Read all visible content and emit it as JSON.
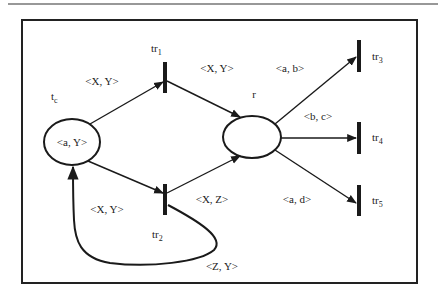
{
  "figure": {
    "type": "colored-petri-net",
    "colors": {
      "stroke": "#1a1a1a",
      "background": "#ffffff",
      "text": "#222222"
    }
  },
  "places": [
    {
      "id": "tc",
      "label": "t",
      "label_sub": "c",
      "token": "<a, Y>"
    },
    {
      "id": "r",
      "label": "r",
      "token": ""
    }
  ],
  "transitions": [
    {
      "id": "tr1",
      "label": "tr",
      "label_sub": "1"
    },
    {
      "id": "tr2",
      "label": "tr",
      "label_sub": "2"
    },
    {
      "id": "tr3",
      "label": "tr",
      "label_sub": "3"
    },
    {
      "id": "tr4",
      "label": "tr",
      "label_sub": "4"
    },
    {
      "id": "tr5",
      "label": "tr",
      "label_sub": "5"
    }
  ],
  "arcs": [
    {
      "from": "tc",
      "to": "tr1",
      "label": "<X, Y>"
    },
    {
      "from": "tr1",
      "to": "r",
      "label": "<X, Y>"
    },
    {
      "from": "tc",
      "to": "tr2",
      "label": "<X, Y>"
    },
    {
      "from": "tr2",
      "to": "r",
      "label": "<X, Z>"
    },
    {
      "from": "tr2",
      "to": "tc",
      "label": "<Z, Y>"
    },
    {
      "from": "r",
      "to": "tr3",
      "label": "<a, b>"
    },
    {
      "from": "r",
      "to": "tr4",
      "label": "<b, c>"
    },
    {
      "from": "r",
      "to": "tr5",
      "label": "<a, d>"
    }
  ]
}
